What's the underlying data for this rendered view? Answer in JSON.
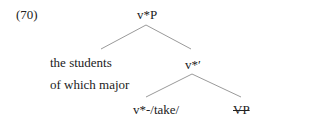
{
  "example_number": "(70)",
  "tree": {
    "root": {
      "label": "v*P",
      "children": [
        "specifier",
        "v_bar"
      ]
    },
    "specifier": {
      "lines": [
        "the students",
        "of which major"
      ]
    },
    "v_bar": {
      "label": "v*′",
      "children": [
        "head",
        "complement"
      ]
    },
    "head": {
      "label": "v*-/take/"
    },
    "complement": {
      "label": "VP",
      "struck_through": true
    }
  },
  "colors": {
    "text": "#222222",
    "edge": "#9a9a9a",
    "background": "#ffffff"
  }
}
